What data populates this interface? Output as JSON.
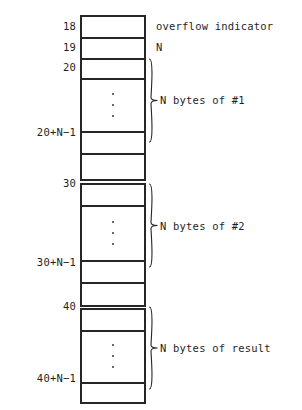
{
  "diagram": {
    "colors": {
      "stroke": "#262626",
      "text": "#1f1f1f",
      "background": "#ffffff"
    },
    "address_labels": [
      {
        "name": "addr-18",
        "text": "18",
        "y": 20
      },
      {
        "name": "addr-19",
        "text": "19",
        "y": 41
      },
      {
        "name": "addr-20",
        "text": "20",
        "y": 61
      },
      {
        "name": "addr-20-n-1",
        "text": "20+N−1",
        "y": 126
      },
      {
        "name": "addr-30",
        "text": "30",
        "y": 177
      },
      {
        "name": "addr-30-n-1",
        "text": "30+N−1",
        "y": 256
      },
      {
        "name": "addr-40",
        "text": "40",
        "y": 300
      },
      {
        "name": "addr-40-n-1",
        "text": "40+N−1",
        "y": 372
      }
    ],
    "cells": [
      {
        "name": "cell-overflow-indicator",
        "top": 0,
        "height": 22,
        "ellipsis": false,
        "last": false
      },
      {
        "name": "cell-n",
        "top": 22,
        "height": 21,
        "ellipsis": false,
        "last": false
      },
      {
        "name": "cell-block1-first",
        "top": 43,
        "height": 20,
        "ellipsis": false,
        "last": false
      },
      {
        "name": "cell-block1-middle",
        "top": 63,
        "height": 53,
        "ellipsis": true,
        "last": false
      },
      {
        "name": "cell-block1-last",
        "top": 116,
        "height": 22,
        "ellipsis": false,
        "last": false
      },
      {
        "name": "cell-gap-1",
        "top": 138,
        "height": 28,
        "ellipsis": false,
        "last": true
      },
      {
        "name": "cell-block2-first",
        "top": 168,
        "height": 22,
        "ellipsis": false,
        "last": false
      },
      {
        "name": "cell-block2-middle",
        "top": 190,
        "height": 55,
        "ellipsis": true,
        "last": false
      },
      {
        "name": "cell-block2-last",
        "top": 245,
        "height": 22,
        "ellipsis": false,
        "last": false
      },
      {
        "name": "cell-gap-2",
        "top": 267,
        "height": 25,
        "ellipsis": false,
        "last": true
      },
      {
        "name": "cell-block3-first",
        "top": 293,
        "height": 22,
        "ellipsis": false,
        "last": false
      },
      {
        "name": "cell-block3-middle",
        "top": 315,
        "height": 52,
        "ellipsis": true,
        "last": false
      },
      {
        "name": "cell-block3-last",
        "top": 367,
        "height": 22,
        "ellipsis": false,
        "last": true
      }
    ],
    "annotations": [
      {
        "name": "annotation-overflow-indicator",
        "text": "overflow indicator",
        "y": 20
      },
      {
        "name": "annotation-n",
        "text": "N",
        "y": 41
      },
      {
        "name": "annotation-n-bytes-1",
        "text": "N bytes of #1",
        "y": 94
      },
      {
        "name": "annotation-n-bytes-2",
        "text": "N bytes of #2",
        "y": 220
      },
      {
        "name": "annotation-n-bytes-result",
        "text": "N bytes of result",
        "y": 342
      }
    ],
    "braces": [
      {
        "name": "brace-block-1",
        "top": 58,
        "height": 85
      },
      {
        "name": "brace-block-2",
        "top": 183,
        "height": 85
      },
      {
        "name": "brace-block-result",
        "top": 306,
        "height": 84
      }
    ]
  }
}
